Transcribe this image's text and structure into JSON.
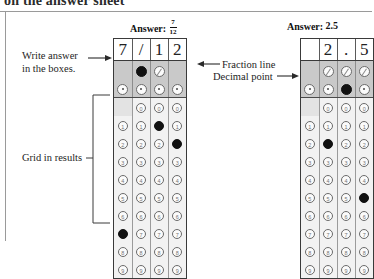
{
  "page": {
    "cut_off_top_text": "on the answer sheet",
    "background": "#ffffff",
    "fill_color": "#111111",
    "shade_color": "#c9c9c9"
  },
  "annotations": {
    "write_answer": "Write answer\nin the boxes.",
    "write_answer_line1": "Write answer",
    "write_answer_line2": "in the boxes.",
    "fraction_line": "Fraction line",
    "decimal_point": "Decimal point",
    "grid_in_results": "Grid in results"
  },
  "panels": [
    {
      "name": "fraction-example",
      "answer_label": "Answer:",
      "answer_kind": "fraction",
      "answer_numerator": "7",
      "answer_denominator": "12",
      "answer_plain": "7/12",
      "columns": 4,
      "written": [
        "7",
        "/",
        "1",
        "2"
      ],
      "slash_row": {
        "symbol": "/",
        "cells": [
          null,
          "slash",
          "slash",
          null
        ],
        "filled": [
          false,
          true,
          false,
          false
        ]
      },
      "dot_row": {
        "symbol": ".",
        "cells": [
          "dot",
          "dot",
          "dot",
          "dot"
        ],
        "filled": [
          false,
          false,
          false,
          false
        ]
      },
      "digits": [
        "0",
        "1",
        "2",
        "3",
        "4",
        "5",
        "6",
        "7",
        "8",
        "9"
      ],
      "zero_row_blank_first": true,
      "filled_digits": [
        7,
        null,
        1,
        2
      ]
    },
    {
      "name": "decimal-example",
      "answer_label": "Answer:",
      "answer_kind": "decimal",
      "answer_plain": "2.5",
      "columns": 4,
      "written": [
        "",
        "2",
        ".",
        "5"
      ],
      "slash_row": {
        "symbol": "/",
        "cells": [
          null,
          "slash",
          "slash",
          "slash"
        ],
        "filled": [
          false,
          false,
          false,
          false
        ]
      },
      "dot_row": {
        "symbol": ".",
        "cells": [
          "dot",
          "dot",
          "dot",
          "dot"
        ],
        "filled": [
          false,
          false,
          true,
          false
        ]
      },
      "digits": [
        "0",
        "1",
        "2",
        "3",
        "4",
        "5",
        "6",
        "7",
        "8",
        "9"
      ],
      "zero_row_blank_first": true,
      "filled_digits": [
        null,
        2,
        null,
        5
      ]
    }
  ]
}
